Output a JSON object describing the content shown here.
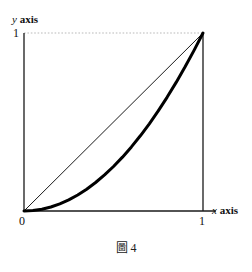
{
  "figure": {
    "caption_label": "圖",
    "caption_number": "4",
    "caption_full": "圖 4"
  },
  "axes": {
    "y_axis_label_var": "y",
    "y_axis_label_word": "axis",
    "x_axis_label_var": "x",
    "x_axis_label_word": "axis",
    "tick_origin": "0",
    "tick_x_one": "1",
    "tick_y_one": "1"
  },
  "colors": {
    "ink": "#111111",
    "curve": "#000000",
    "chord": "#1a1a1a",
    "guide_dotted": "#b9b9b9",
    "background": "#ffffff"
  },
  "chart_data": {
    "type": "line",
    "title": "",
    "xlabel": "x axis",
    "ylabel": "y axis",
    "xlim": [
      0,
      1
    ],
    "ylim": [
      0,
      1
    ],
    "xticks": [
      0,
      1
    ],
    "xticklabels": [
      "0",
      "1"
    ],
    "yticks": [
      0,
      1
    ],
    "yticklabels": [
      "0",
      "1"
    ],
    "grid": false,
    "legend": null,
    "annotations": [
      {
        "text": "圖 4",
        "role": "figure-caption",
        "position": "below-axes-center"
      }
    ],
    "guides": [
      {
        "name": "y-one-dotted-guide",
        "style": "dotted",
        "color": "#b9b9b9",
        "from": [
          0,
          1
        ],
        "to": [
          1,
          1
        ]
      },
      {
        "name": "x-one-vertical-rule",
        "style": "solid",
        "color": "#1a1a1a",
        "from": [
          1,
          0
        ],
        "to": [
          1,
          1
        ]
      }
    ],
    "series": [
      {
        "name": "chord",
        "style": "thin-straight-line",
        "linewidth": 1,
        "color": "#1a1a1a",
        "x": [
          0,
          1
        ],
        "values": [
          0,
          1
        ]
      },
      {
        "name": "curve",
        "style": "thick-convex-curve",
        "linewidth": 3,
        "color": "#000000",
        "equation": "y = x^2",
        "x": [
          0.0,
          0.05,
          0.1,
          0.15,
          0.2,
          0.25,
          0.3,
          0.35,
          0.4,
          0.45,
          0.5,
          0.55,
          0.6,
          0.65,
          0.7,
          0.75,
          0.8,
          0.85,
          0.9,
          0.95,
          1.0
        ],
        "values": [
          0.0,
          0.0025,
          0.01,
          0.0225,
          0.04,
          0.0625,
          0.09,
          0.1225,
          0.16,
          0.2025,
          0.25,
          0.3025,
          0.36,
          0.4225,
          0.49,
          0.5625,
          0.64,
          0.7225,
          0.81,
          0.9025,
          1.0
        ]
      }
    ]
  }
}
